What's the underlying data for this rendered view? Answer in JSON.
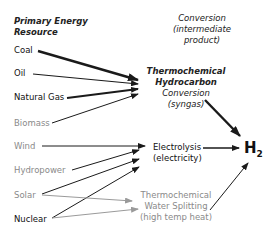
{
  "columns": {
    "source_header": [
      "Primary Energy",
      "Resource"
    ],
    "conversion_header": [
      "Conversion",
      "(intermediate",
      "product)"
    ]
  },
  "resources": [
    {
      "label": "Coal",
      "style": "dark"
    },
    {
      "label": "Oil",
      "style": "dark"
    },
    {
      "label": "Natural Gas",
      "style": "dark"
    },
    {
      "label": "Biomass",
      "style": "gray"
    },
    {
      "label": "Wind",
      "style": "gray"
    },
    {
      "label": "Hydropower",
      "style": "gray"
    },
    {
      "label": "Solar",
      "style": "gray"
    },
    {
      "label": "Nuclear",
      "style": "dark"
    }
  ],
  "conversions": {
    "thermo_hydrocarbon": [
      "Thermochemical",
      "Hydrocarbon",
      "Conversion",
      "(syngas)"
    ],
    "electrolysis": [
      "Electrolysis",
      "(electricity)"
    ],
    "thermo_water": [
      "Thermochemical",
      "Water Splitting",
      "(high temp heat)"
    ]
  },
  "product": {
    "main": "H",
    "sub": "2"
  },
  "colors": {
    "dark": "#1a1a1a",
    "gray": "#8a8a8a",
    "arrow_dark": "#1a1a1a",
    "arrow_gray": "#9a9a9a"
  }
}
